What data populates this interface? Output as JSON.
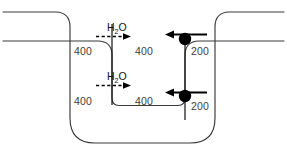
{
  "figure": {
    "colors": {
      "outline": "#3a3a3a",
      "conduit": "#1a1a1a",
      "arrow": "#000000",
      "node": "#000000",
      "number_text": "#3d3d3d",
      "background": "#ffffff"
    }
  },
  "labels": {
    "upper_left_flow": "400",
    "upper_mid_flow": "400",
    "upper_right_flow": "200",
    "lower_left_flow": "400",
    "lower_mid_flow": "400",
    "lower_right_flow": "200"
  },
  "chemicals": {
    "upper_injection": "H",
    "upper_injection_sub": "2",
    "upper_injection_tail": "O",
    "lower_injection": "H",
    "lower_injection_sub": "2",
    "lower_injection_tail": "O"
  },
  "arrows": {
    "upper_water_direction": "right",
    "lower_water_direction": "right",
    "upper_node_direction": "left",
    "lower_node_direction": "left"
  },
  "nodes": {
    "upper_node": "valve-node",
    "lower_node": "valve-node"
  }
}
